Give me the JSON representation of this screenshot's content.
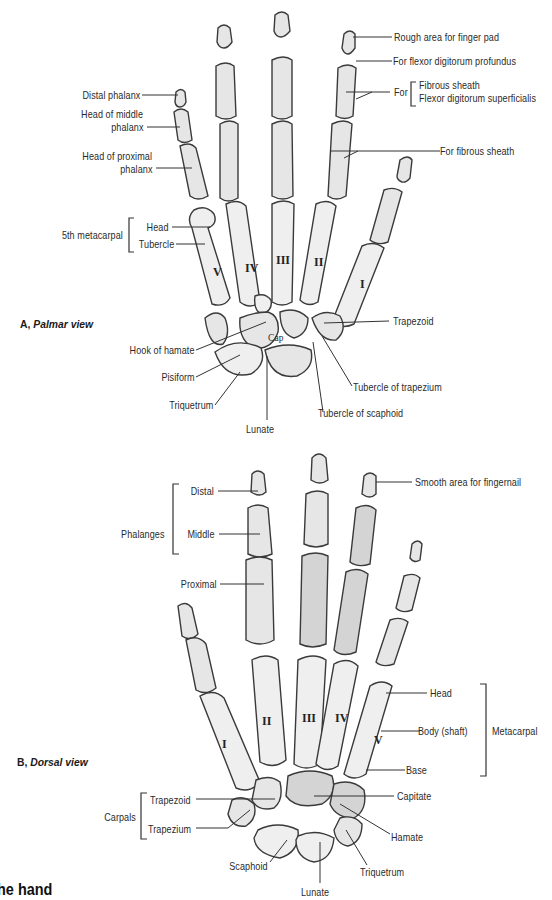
{
  "figure": {
    "title_fragment": "he hand",
    "colors": {
      "background": "#ffffff",
      "bone_fill": "#e6e6e6",
      "bone_outline": "#3a3a3a",
      "label_text": "#2a2a2a"
    }
  },
  "palmar": {
    "caption_letter": "A,",
    "caption_view": "Palmar view",
    "labels": {
      "distal_phalanx": "Distal phalanx",
      "head_middle_1": "Head of middle",
      "head_middle_2": "phalanx",
      "head_proximal_1": "Head of proximal",
      "head_proximal_2": "phalanx",
      "fifth_metacarpal": "5th metacarpal",
      "head": "Head",
      "tubercle": "Tubercle",
      "hook_of_hamate": "Hook of hamate",
      "pisiform": "Pisiform",
      "triquetrum": "Triquetrum",
      "lunate": "Lunate",
      "tubercle_of_scaphoid": "Tubercle of scaphoid",
      "tubercle_of_trapezium": "Tubercle of trapezium",
      "trapezoid": "Trapezoid",
      "rough_area": "Rough area for finger pad",
      "flexor_profundus": "For flexor digitorum profundus",
      "for": "For",
      "fibrous_sheath": "Fibrous sheath",
      "flexor_superficialis": "Flexor digitorum superficialis",
      "for_fibrous_sheath": "For fibrous sheath",
      "cap": "Cap"
    },
    "numerals": [
      "V",
      "IV",
      "III",
      "II",
      "I"
    ]
  },
  "dorsal": {
    "caption_letter": "B,",
    "caption_view": "Dorsal view",
    "labels": {
      "phalanges": "Phalanges",
      "distal": "Distal",
      "middle": "Middle",
      "proximal": "Proximal",
      "smooth_area": "Smooth area for fingernail",
      "head": "Head",
      "body_shaft": "Body (shaft)",
      "base": "Base",
      "metacarpal": "Metacarpal",
      "capitate": "Capitate",
      "hamate": "Hamate",
      "triquetrum": "Triquetrum",
      "lunate": "Lunate",
      "scaphoid": "Scaphoid",
      "carpals": "Carpals",
      "trapezoid": "Trapezoid",
      "trapezium": "Trapezium"
    },
    "numerals": [
      "I",
      "II",
      "III",
      "IV",
      "V"
    ]
  }
}
